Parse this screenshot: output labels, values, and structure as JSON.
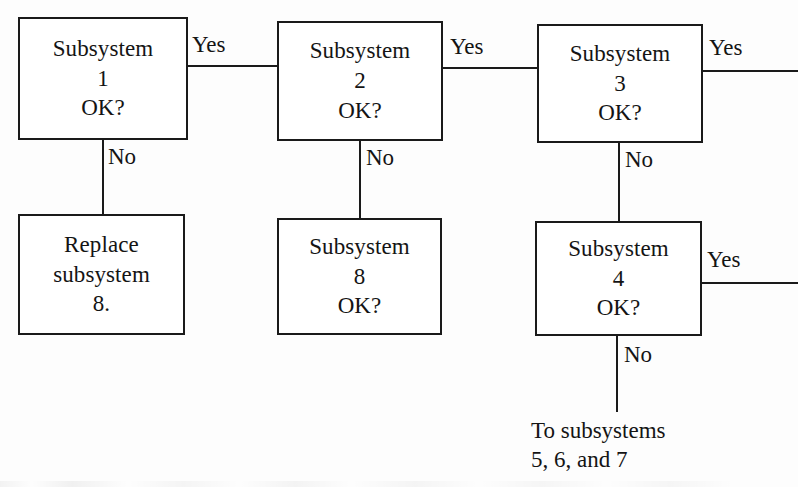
{
  "diagram": {
    "type": "flowchart",
    "nodes": [
      {
        "id": "subsystem-1",
        "lines": [
          "Subsystem",
          "1",
          "OK?"
        ],
        "x": 18,
        "y": 17,
        "w": 170,
        "h": 123
      },
      {
        "id": "subsystem-2",
        "lines": [
          "Subsystem",
          "2",
          "OK?"
        ],
        "x": 277,
        "y": 21,
        "w": 166,
        "h": 120
      },
      {
        "id": "subsystem-3",
        "lines": [
          "Subsystem",
          "3",
          "OK?"
        ],
        "x": 537,
        "y": 24,
        "w": 166,
        "h": 119
      },
      {
        "id": "replace-subsystem-8",
        "lines": [
          "Replace",
          "subsystem",
          "8."
        ],
        "x": 18,
        "y": 214,
        "w": 167,
        "h": 121
      },
      {
        "id": "subsystem-8",
        "lines": [
          "Subsystem",
          "8",
          "OK?"
        ],
        "x": 277,
        "y": 218,
        "w": 165,
        "h": 117
      },
      {
        "id": "subsystem-4",
        "lines": [
          "Subsystem",
          "4",
          "OK?"
        ],
        "x": 535,
        "y": 221,
        "w": 167,
        "h": 115
      }
    ],
    "edge_labels": [
      {
        "id": "yes-1-to-2",
        "text": "Yes",
        "x": 192,
        "y": 33
      },
      {
        "id": "no-1-to-replace",
        "text": "No",
        "x": 108,
        "y": 145
      },
      {
        "id": "yes-2-to-3",
        "text": "Yes",
        "x": 450,
        "y": 35
      },
      {
        "id": "no-2-to-8",
        "text": "No",
        "x": 366,
        "y": 146
      },
      {
        "id": "yes-3-out",
        "text": "Yes",
        "x": 709,
        "y": 36
      },
      {
        "id": "no-3-to-4",
        "text": "No",
        "x": 625,
        "y": 148
      },
      {
        "id": "yes-4-out",
        "text": "Yes",
        "x": 707,
        "y": 248
      },
      {
        "id": "no-4-out",
        "text": "No",
        "x": 624,
        "y": 343
      }
    ],
    "free_text": [
      {
        "id": "to-subsystems-note",
        "lines": [
          "To subsystems",
          "5, 6, and 7"
        ],
        "x": 531,
        "y": 416
      }
    ],
    "colors": {
      "stroke": "#1a1a1a",
      "text": "#141414",
      "background": "#fdfdfd",
      "box_fill": "#ffffff"
    }
  }
}
